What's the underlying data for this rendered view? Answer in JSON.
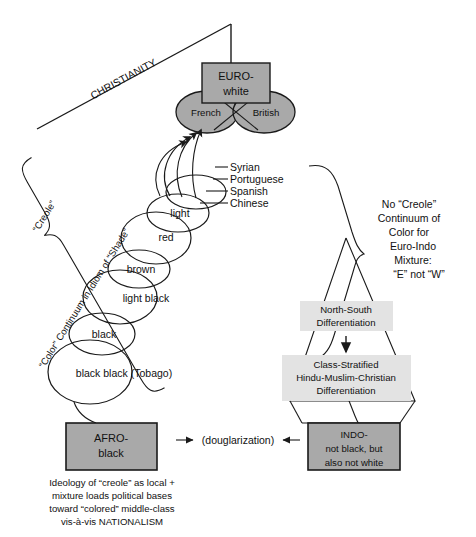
{
  "diagram": {
    "title_label": "CHRISTIANITY",
    "colors": {
      "dark_gray_fill": "#a9a9a9",
      "light_gray_fill": "#e3e3e3",
      "stroke": "#1a1a1a",
      "background": "#ffffff"
    },
    "euro_box": {
      "line1": "EURO-",
      "line2": "white"
    },
    "euro_ellipses": [
      {
        "label": "French"
      },
      {
        "label": "British"
      }
    ],
    "immigrant_groups": [
      {
        "label": "Syrian"
      },
      {
        "label": "Portuguese"
      },
      {
        "label": "Spanish"
      },
      {
        "label": "Chinese"
      }
    ],
    "color_continuum": [
      {
        "label": "light"
      },
      {
        "label": "red"
      },
      {
        "label": "brown"
      },
      {
        "label": "light black"
      },
      {
        "label": "black"
      },
      {
        "label": "black black (Tobago)"
      }
    ],
    "left_brace": {
      "top_label": "“Creole”",
      "main_label": "“Color” Continuum in Idiom of “Shade”"
    },
    "right_brace_note": [
      "No “Creole”",
      "Continuum of",
      "Color for",
      "Euro-Indo",
      "Mixture:",
      "“E” not “W”"
    ],
    "north_south_box": {
      "line1": "North-South",
      "line2": "Differentiation"
    },
    "class_box": {
      "line1": "Class-Stratified",
      "line2": "Hindu-Muslim-Christian",
      "line3": "Differentiation"
    },
    "afro_box": {
      "line1": "AFRO-",
      "line2": "black"
    },
    "indo_box": {
      "line1": "INDO-",
      "line2": "not black, but",
      "line3": "also not white"
    },
    "douglarization_label": "(douglarization)",
    "bottom_caption": [
      "Ideology of “creole” as local +",
      "mixture loads political bases",
      "toward “colored” middle-class",
      "vis-à-vis NATIONALISM"
    ]
  }
}
